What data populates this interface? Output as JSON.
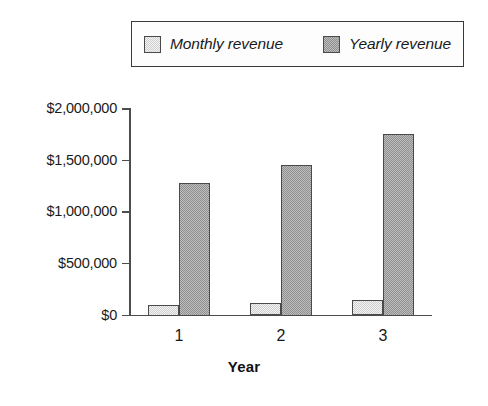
{
  "chart_data": {
    "type": "bar",
    "title": "",
    "subtitle": "",
    "xlabel": "Year",
    "ylabel": "",
    "categories": [
      "1",
      "2",
      "3"
    ],
    "series": [
      {
        "name": "Monthly revenue",
        "values": [
          100000,
          120000,
          145000
        ],
        "color": "#cfcfcf"
      },
      {
        "name": "Yearly revenue",
        "values": [
          1275000,
          1450000,
          1750000
        ],
        "color": "#8f8f8f"
      }
    ],
    "ylim": [
      0,
      2000000
    ],
    "y_ticks": [
      0,
      500000,
      1000000,
      1500000,
      2000000
    ],
    "y_tick_labels": [
      "$0",
      "$500,000",
      "$1,000,000",
      "$1,500,000",
      "$2,000,000"
    ],
    "x_tick_labels": [
      "1",
      "2",
      "3"
    ],
    "grid": false,
    "legend_position": "top",
    "legend_entries": [
      "Monthly revenue",
      "Yearly revenue"
    ],
    "annotations": []
  },
  "legend": {
    "entries": [
      {
        "label": "Monthly revenue",
        "swatch_color": "#cfcfcf"
      },
      {
        "label": "Yearly revenue",
        "swatch_color": "#8f8f8f"
      }
    ]
  },
  "axes": {
    "x_title": "Year"
  }
}
